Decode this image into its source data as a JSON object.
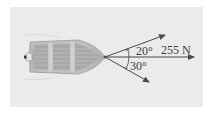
{
  "diagram": {
    "labels": {
      "resultant_force": "255 N",
      "upper_angle": "20°",
      "lower_angle": "30°"
    },
    "forces": [
      {
        "name": "upper-rope",
        "angle_deg": 20,
        "direction": "above horizontal"
      },
      {
        "name": "resultant",
        "angle_deg": 0,
        "magnitude": "255 N",
        "direction": "horizontal"
      },
      {
        "name": "lower-rope",
        "angle_deg": -30,
        "direction": "below horizontal"
      }
    ],
    "colors": {
      "background_panel": "#ebebeb",
      "arrow": "#4a4a4a",
      "boat_hull": "#b8b8b8",
      "boat_interior": "#9e9e9e",
      "text": "#3a3a3a"
    }
  }
}
